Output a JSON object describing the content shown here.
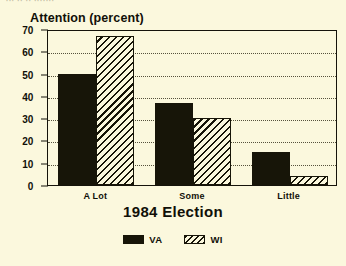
{
  "scan_fragment": "··· ·· ·· ·······",
  "chart_data": {
    "type": "bar",
    "title": "",
    "ylabel": "Attention (percent)",
    "xlabel": "1984 Election",
    "categories": [
      "A Lot",
      "Some",
      "Little"
    ],
    "series": [
      {
        "name": "VA",
        "values": [
          50,
          37,
          15
        ],
        "fill": "solid",
        "color": "#171508"
      },
      {
        "name": "WI",
        "values": [
          67,
          30,
          4
        ],
        "fill": "diagonal-hatch",
        "color": "#171508"
      }
    ],
    "ylim": [
      0,
      70
    ],
    "yticks": [
      0,
      10,
      20,
      30,
      40,
      50,
      60,
      70
    ],
    "ytick_labels": [
      "0",
      "10",
      "20",
      "30",
      "40",
      "50",
      "60",
      "70"
    ],
    "grid": true,
    "grid_style": "dotted-horizontal",
    "legend_position": "bottom-center",
    "legend_entries": [
      "VA",
      "WI"
    ],
    "background_color": "#fbf8dd",
    "axis_color": "#171508"
  }
}
